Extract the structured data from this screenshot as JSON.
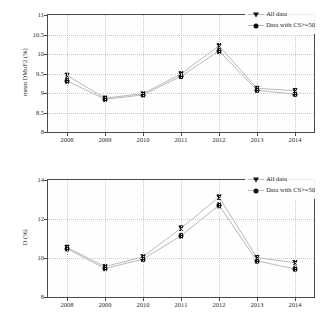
{
  "figure": {
    "background": "#ffffff",
    "line_color": "#b9b9b9",
    "marker_color": "#101010",
    "grid_color": "#c9c9c9",
    "axis_color": "#4a4a4a"
  },
  "legend": {
    "all_data_label": "All data",
    "cs_data_label": "Data with CS>=50",
    "all_data_marker": "triangle-down-marker",
    "cs_data_marker": "circle-marker",
    "position": "top-right"
  },
  "chart_data": [
    {
      "type": "line",
      "id": "mean-dmof2-chart",
      "title": "",
      "xlabel": "",
      "ylabel": "mean DMoF2 (%)",
      "categories": [
        "2008",
        "2009",
        "2010",
        "2011",
        "2012",
        "2013",
        "2014"
      ],
      "x": [
        2008,
        2009,
        2010,
        2011,
        2012,
        2013,
        2014
      ],
      "ylim": [
        8,
        11
      ],
      "yticks": [
        8,
        8.5,
        9,
        9.5,
        10,
        10.5,
        11
      ],
      "ytick_labels": [
        "8",
        "8.5",
        "9",
        "9.5",
        "10",
        "10.5",
        "11"
      ],
      "xlim": [
        2007.5,
        2014.5
      ],
      "grid": true,
      "legend_position": "top-right",
      "series": [
        {
          "name": "All data",
          "marker": "triangle-down-marker",
          "values": [
            9.45,
            8.87,
            8.98,
            9.49,
            10.21,
            9.12,
            9.06
          ],
          "errors": [
            0.06,
            0.05,
            0.05,
            0.06,
            0.06,
            0.05,
            0.05
          ]
        },
        {
          "name": "Data with CS>=50",
          "marker": "circle-marker",
          "values": [
            9.31,
            8.84,
            8.95,
            9.43,
            10.08,
            9.07,
            8.97
          ],
          "errors": [
            0.06,
            0.05,
            0.05,
            0.06,
            0.07,
            0.05,
            0.05
          ]
        }
      ]
    },
    {
      "type": "line",
      "id": "d-percent-chart",
      "title": "",
      "xlabel": "",
      "ylabel": "D (%)",
      "categories": [
        "2008",
        "2009",
        "2010",
        "2011",
        "2012",
        "2013",
        "2014"
      ],
      "x": [
        2008,
        2009,
        2010,
        2011,
        2012,
        2013,
        2014
      ],
      "ylim": [
        8,
        14
      ],
      "yticks": [
        8,
        10,
        12,
        14
      ],
      "ytick_labels": [
        "8",
        "10",
        "12",
        "14"
      ],
      "xlim": [
        2007.5,
        2014.5
      ],
      "grid": true,
      "legend_position": "top-right",
      "series": [
        {
          "name": "All data",
          "marker": "triangle-down-marker",
          "values": [
            10.54,
            9.56,
            10.06,
            11.53,
            13.12,
            10.02,
            9.76
          ],
          "errors": [
            0.12,
            0.11,
            0.11,
            0.12,
            0.12,
            0.11,
            0.11
          ]
        },
        {
          "name": "Data with CS>=50",
          "marker": "circle-marker",
          "values": [
            10.48,
            9.46,
            9.94,
            11.14,
            12.7,
            9.85,
            9.44
          ],
          "errors": [
            0.12,
            0.11,
            0.11,
            0.12,
            0.13,
            0.11,
            0.11
          ]
        }
      ]
    }
  ]
}
